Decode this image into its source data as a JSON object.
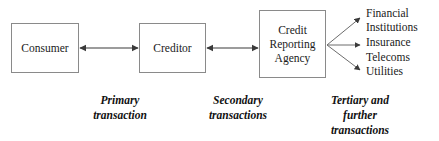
{
  "diagram": {
    "stroke_color": "#3a3a3a",
    "box_border_color": "#8a8a8a",
    "text_color": "#1a1a1a",
    "background_color": "#ffffff",
    "nodes": [
      {
        "id": "consumer",
        "label": "Consumer"
      },
      {
        "id": "creditor",
        "label": "Creditor"
      },
      {
        "id": "cra",
        "label": "Credit\nReporting\nAgency"
      }
    ],
    "endpoints": [
      {
        "id": "financial-institutions",
        "label": "Financial\nInstitutions"
      },
      {
        "id": "insurance",
        "label": "Insurance"
      },
      {
        "id": "telecoms",
        "label": "Telecoms"
      },
      {
        "id": "utilities",
        "label": "Utilities"
      }
    ],
    "captions": [
      {
        "id": "primary",
        "label": "Primary\ntransaction"
      },
      {
        "id": "secondary",
        "label": "Secondary\ntransactions"
      },
      {
        "id": "tertiary",
        "label": "Tertiary and\nfurther\ntransactions"
      }
    ],
    "connectors": [
      {
        "id": "consumer-creditor",
        "from": "consumer",
        "to": "creditor",
        "arrowheads": "both"
      },
      {
        "id": "creditor-cra",
        "from": "creditor",
        "to": "cra",
        "arrowheads": "both"
      },
      {
        "id": "cra-financial-institutions",
        "from": "cra",
        "to": "financial-institutions",
        "arrowheads": "end"
      },
      {
        "id": "cra-insurance",
        "from": "cra",
        "to": "insurance",
        "arrowheads": "end"
      },
      {
        "id": "cra-telecoms",
        "from": "cra",
        "to": "telecoms",
        "arrowheads": "end"
      }
    ]
  }
}
